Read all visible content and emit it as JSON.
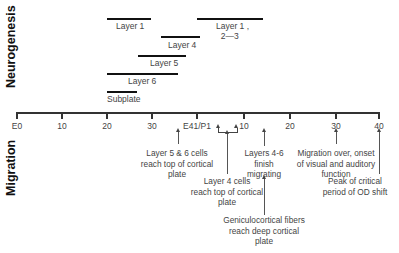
{
  "sections": {
    "top_label": "Neurogenesis",
    "bottom_label": "Migration"
  },
  "neurogenesis_bars": [
    {
      "label": "Layer 1",
      "x1": 107,
      "x2": 151,
      "y": 18,
      "label_x": 116,
      "label_y": 21
    },
    {
      "label": "Layer 1 ,\n  2—3",
      "x1": 197,
      "x2": 263,
      "y": 18,
      "label_x": 216,
      "label_y": 21
    },
    {
      "label": "Layer 4",
      "x1": 161,
      "x2": 200,
      "y": 36,
      "label_x": 168,
      "label_y": 40
    },
    {
      "label": "Layer 5",
      "x1": 138,
      "x2": 186,
      "y": 55,
      "label_x": 150,
      "label_y": 58
    },
    {
      "label": "Layer 6",
      "x1": 107,
      "x2": 178,
      "y": 73,
      "label_x": 128,
      "label_y": 76
    },
    {
      "label": "Subplate",
      "x1": 107,
      "x2": 137,
      "y": 91,
      "label_x": 107,
      "label_y": 94
    }
  ],
  "axis": {
    "y": 112,
    "x_start": 17,
    "x_end": 380,
    "ticks": [
      {
        "label": "E0",
        "x": 17
      },
      {
        "label": "10",
        "x": 62
      },
      {
        "label": "20",
        "x": 107
      },
      {
        "label": "30",
        "x": 152
      },
      {
        "label": "E41/P1",
        "x": 197
      },
      {
        "label": "10",
        "x": 244
      },
      {
        "label": "20",
        "x": 290
      },
      {
        "label": "30",
        "x": 336
      },
      {
        "label": "40",
        "x": 379
      }
    ]
  },
  "bracket": {
    "x1": 218,
    "x2": 236,
    "y": 128
  },
  "annotations": [
    {
      "text": "Layer 5 & 6 cells\nreach top of cortical\nplate",
      "arrow_x": 178,
      "arrow_top": 131,
      "arrow_bottom": 144,
      "text_x": 177,
      "text_y": 148
    },
    {
      "text": "Layer 4 cells\nreach top of cortical\nplate",
      "arrow_x": 227,
      "arrow_top": 133,
      "arrow_bottom": 174,
      "text_x": 227,
      "text_y": 176
    },
    {
      "text": "Layers 4-6\nfinish\nmigrating",
      "arrow_x": 264,
      "arrow_top": 131,
      "arrow_bottom": 146,
      "text_x": 264,
      "text_y": 148
    },
    {
      "text": "Geniculocortical fibers\nreach deep cortical\nplate",
      "arrow_x": 264,
      "arrow_top": 178,
      "arrow_bottom": 215,
      "text_x": 264,
      "text_y": 215
    },
    {
      "text": "Migration over, onset\nof visual and auditory\nfunction",
      "arrow_x": 336,
      "arrow_top": 131,
      "arrow_bottom": 144,
      "text_x": 336,
      "text_y": 148
    },
    {
      "text": "Peak of critical\nperiod of OD shift",
      "arrow_x": 379,
      "arrow_top": 131,
      "arrow_bottom": 174,
      "text_x": 355,
      "text_y": 176
    }
  ]
}
